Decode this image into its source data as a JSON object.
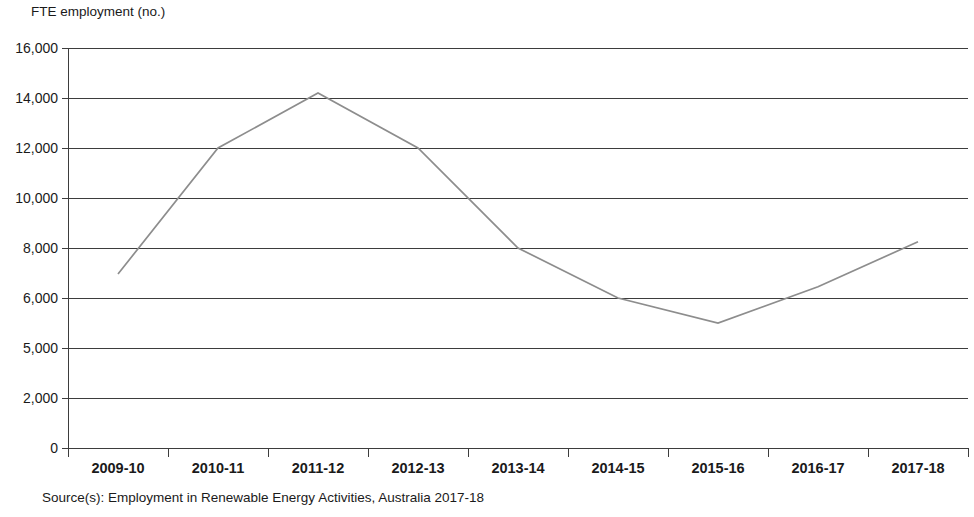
{
  "chart_data": {
    "type": "line",
    "title": "",
    "ylabel": "FTE employment (no.)",
    "xlabel": "",
    "grid": true,
    "legend": "none",
    "categories": [
      "2009-10",
      "2010-11",
      "2011-12",
      "2012-13",
      "2013-14",
      "2014-15",
      "2015-16",
      "2016-17",
      "2017-18"
    ],
    "ytick_labels": [
      "16,000",
      "14,000",
      "12,000",
      "10,000",
      "8,000",
      "6,000",
      "5,000",
      "2,000",
      "0"
    ],
    "ytick_values": [
      16000,
      14000,
      12000,
      10000,
      8000,
      6000,
      5000,
      2000,
      0
    ],
    "series": [
      {
        "name": "FTE employment",
        "color": "#8d8d8d",
        "values": [
          6960,
          12000,
          14200,
          12000,
          8000,
          6000,
          5500,
          6450,
          8250
        ]
      }
    ],
    "source": "Source(s): Employment in Renewable Energy Activities, Australia 2017-18"
  },
  "axis": {
    "y_title": "FTE employment (no.)"
  },
  "footer": {
    "source": "Source(s): Employment in Renewable Energy Activities, Australia 2017-18"
  },
  "colors": {
    "series_line": "#8d8d8d",
    "gridline": "#3d3d3d",
    "text": "#1a1a1a",
    "background": "#ffffff"
  }
}
